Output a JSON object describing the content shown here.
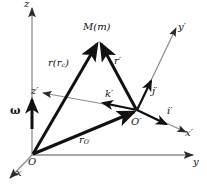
{
  "figure": {
    "colors": {
      "axis": "#8c8c8c",
      "vector": "#111111",
      "background": "#ffffff",
      "text": "#111111"
    }
  },
  "axes": {
    "fixed": [
      {
        "name": "z-axis",
        "label": "z",
        "label_sub": ""
      },
      {
        "name": "y-axis",
        "label": "y",
        "label_sub": ""
      },
      {
        "name": "x-axis",
        "label": "x",
        "label_sub": ""
      }
    ],
    "moving": [
      {
        "name": "z-prime-axis",
        "label": "z",
        "prime": "′"
      },
      {
        "name": "y-prime-axis",
        "label": "y",
        "prime": "′"
      },
      {
        "name": "x-prime-axis",
        "label": "x",
        "prime": "′"
      }
    ]
  },
  "points": {
    "origin": "O",
    "moving_origin": "O",
    "moving_origin_prime": "′",
    "mass_point": "M(m)"
  },
  "vectors": {
    "r": {
      "label": "r",
      "paren_open": "(",
      "sub": "c",
      "paren_close": ")"
    },
    "r_prime": {
      "label": "r",
      "prime": "′"
    },
    "r_Oprime": {
      "label": "r",
      "sub": "O′"
    },
    "omega": {
      "label": "ω"
    }
  },
  "unit_vectors": [
    {
      "name": "i-prime",
      "label": "i",
      "prime": "′"
    },
    {
      "name": "j-prime",
      "label": "j",
      "prime": "′"
    },
    {
      "name": "k-prime",
      "label": "k",
      "prime": "′"
    }
  ]
}
